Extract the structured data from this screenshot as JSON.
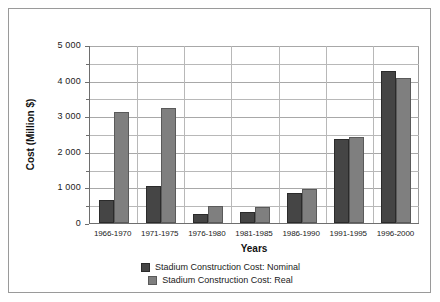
{
  "chart_data": {
    "type": "bar",
    "title": "",
    "xlabel": "Years",
    "ylabel": "Cost (Million $)",
    "ylim": [
      0,
      5000
    ],
    "ytick_step": 1000,
    "yminor_step": 500,
    "grid": true,
    "legend_position": "bottom",
    "categories": [
      "1966-1970",
      "1971-1975",
      "1976-1980",
      "1981-1985",
      "1986-1990",
      "1991-1995",
      "1996-2000"
    ],
    "ytick_labels": [
      "0",
      "1 000",
      "2 000",
      "3 000",
      "4 000",
      "5 000"
    ],
    "ytick_values": [
      0,
      1000,
      2000,
      3000,
      4000,
      5000
    ],
    "series": [
      {
        "name": "Stadium Construction Cost: Nominal",
        "color": "#454545",
        "values": [
          660,
          1050,
          250,
          300,
          830,
          2350,
          4280
        ]
      },
      {
        "name": "Stadium Construction Cost: Real",
        "color": "#7f7f7f",
        "values": [
          3130,
          3230,
          490,
          460,
          950,
          2430,
          4080
        ]
      }
    ]
  },
  "legend": {
    "items": [
      {
        "label": "Stadium Construction Cost: Nominal",
        "swatch": "nominal"
      },
      {
        "label": "Stadium Construction Cost: Real",
        "swatch": "real"
      }
    ]
  }
}
